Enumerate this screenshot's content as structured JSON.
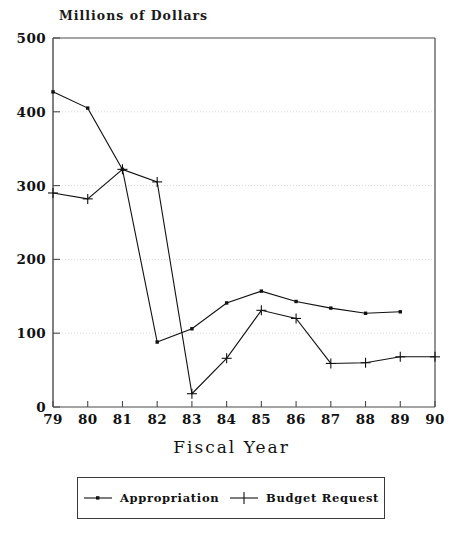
{
  "chart_data": {
    "type": "line",
    "title": "Millions of Dollars",
    "xlabel": "Fiscal Year",
    "ylabel": "",
    "x": [
      79,
      80,
      81,
      82,
      83,
      84,
      85,
      86,
      87,
      88,
      89,
      90
    ],
    "categories": [
      "79",
      "80",
      "81",
      "82",
      "83",
      "84",
      "85",
      "86",
      "87",
      "88",
      "89",
      "90"
    ],
    "xlim": [
      79,
      90
    ],
    "ylim": [
      0,
      500
    ],
    "y_ticks": [
      0,
      100,
      200,
      300,
      400,
      500
    ],
    "y_tick_labels": [
      "0",
      "100",
      "200",
      "300",
      "400",
      "500"
    ],
    "grid": "horizontal-dotted",
    "legend_position": "below-outside",
    "series": [
      {
        "name": "Appropriation",
        "marker": "dot",
        "color": "#111111",
        "x": [
          79,
          80,
          81,
          82,
          83,
          84,
          85,
          86,
          87,
          88,
          89
        ],
        "values": [
          427,
          405,
          322,
          88,
          106,
          141,
          157,
          143,
          134,
          127,
          129
        ]
      },
      {
        "name": "Budget Request",
        "marker": "plus",
        "color": "#111111",
        "x": [
          79,
          80,
          81,
          82,
          83,
          84,
          85,
          86,
          87,
          88,
          89,
          90
        ],
        "values": [
          290,
          282,
          322,
          305,
          18,
          66,
          131,
          120,
          59,
          60,
          68,
          68
        ]
      }
    ]
  },
  "legend": {
    "entries": [
      {
        "label": "Appropriation",
        "marker": "dot"
      },
      {
        "label": "Budget Request",
        "marker": "plus"
      }
    ]
  },
  "colors": {
    "ink": "#111111",
    "axis": "#4a4a4a",
    "grid": "#d9d9d9",
    "background": "#ffffff"
  }
}
